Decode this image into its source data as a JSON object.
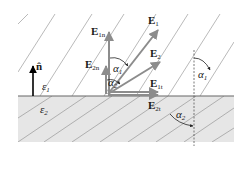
{
  "diagram": {
    "regions": {
      "upper": {
        "label_base": "ε",
        "label_sub": "1",
        "fill": "#ffffff"
      },
      "lower": {
        "label_base": "ε",
        "label_sub": "2",
        "fill": "#e6e6e6"
      }
    },
    "normal": {
      "label": "n̂"
    },
    "vectors": {
      "E1": {
        "base": "E",
        "sub": "1"
      },
      "E2": {
        "base": "E",
        "sub": "2"
      },
      "E1n": {
        "base": "E",
        "sub": "1n"
      },
      "E2n": {
        "base": "E",
        "sub": "2n"
      },
      "E1t": {
        "base": "E",
        "sub": "1t"
      },
      "E2t": {
        "base": "E",
        "sub": "2t"
      }
    },
    "angles": {
      "a1_origin": {
        "base": "α",
        "sub": "1"
      },
      "a2_origin": {
        "base": "α",
        "sub": "2"
      },
      "a1_right": {
        "base": "α",
        "sub": "1"
      },
      "a2_right": {
        "base": "α",
        "sub": "2"
      }
    },
    "colors": {
      "field_line": "#8a8a8a",
      "vector": "#8c8c8c",
      "normal": "#000000",
      "boundary": "#666666",
      "dashed": "#555555",
      "lower_fill": "#e6e6e6"
    }
  }
}
